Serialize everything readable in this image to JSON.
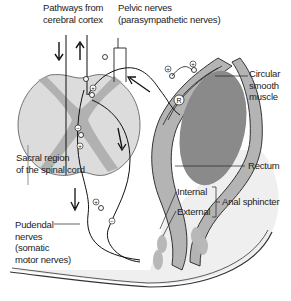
{
  "diagram": {
    "type": "anatomical-diagram",
    "colors": {
      "background": "#ffffff",
      "spinal_cord": "#dcdcdc",
      "gray_matter": "#a9a9a9",
      "rectum_wall": "#b4b4b4",
      "rectum_lumen": "#8a8a8a",
      "pelvic_floor": "#eeeeee",
      "sphincter": "#b8b8b8",
      "line": "#222222"
    },
    "labels": {
      "pathways_line1": "Pathways from",
      "pathways_line2": "cerebral cortex",
      "pelvic_line1": "Pelvic nerves",
      "pelvic_line2": "(parasympathetic nerves)",
      "circular_line1": "Circular",
      "circular_line2": "smooth",
      "circular_line3": "muscle",
      "sacral_line1": "Sacral region",
      "sacral_line2": "of the spinal cord",
      "rectum": "Rectum",
      "internal": "Internal",
      "external": "External",
      "anal_sphincter": "Anal sphincter",
      "pudendal_line1": "Pudendal",
      "pudendal_line2": "nerves",
      "pudendal_line3": "(somatic",
      "pudendal_line4": "motor nerves)"
    },
    "symbols": {
      "plus": "+",
      "minus": "−",
      "receptor": "R"
    }
  }
}
